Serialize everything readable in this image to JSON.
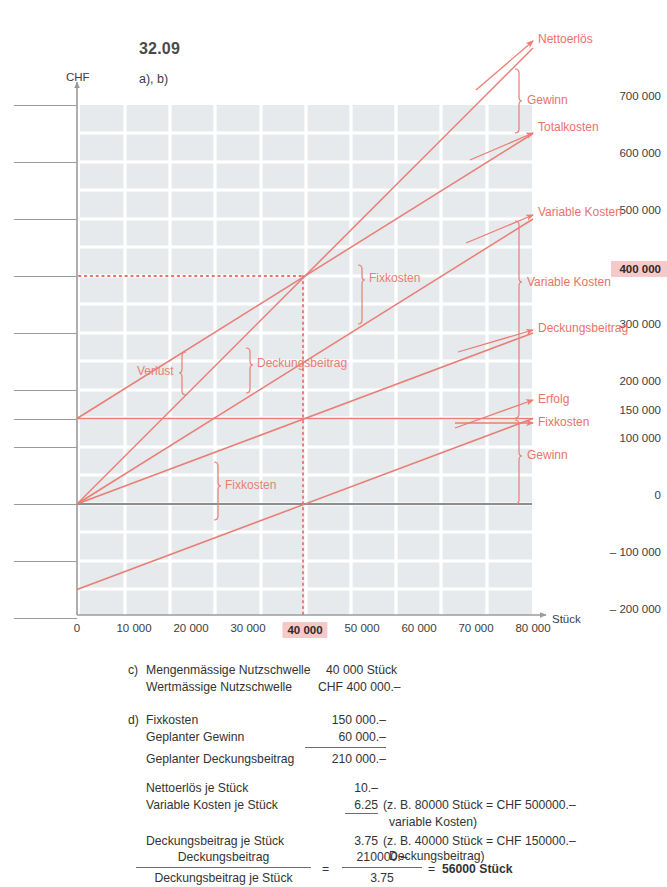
{
  "exercise": {
    "number": "32.09",
    "subparts": "a), b)"
  },
  "axes": {
    "y_unit": "CHF",
    "x_unit": "Stück",
    "y_ticks": [
      {
        "label": "700 000",
        "value": 700000,
        "highlight": false
      },
      {
        "label": "600 000",
        "value": 600000,
        "highlight": false
      },
      {
        "label": "500 000",
        "value": 500000,
        "highlight": false
      },
      {
        "label": "400 000",
        "value": 400000,
        "highlight": true
      },
      {
        "label": "300 000",
        "value": 300000,
        "highlight": false
      },
      {
        "label": "200 000",
        "value": 200000,
        "highlight": false
      },
      {
        "label": "150 000",
        "value": 150000,
        "highlight": false
      },
      {
        "label": "100 000",
        "value": 100000,
        "highlight": false
      },
      {
        "label": "0",
        "value": 0,
        "highlight": false
      },
      {
        "label": "– 100 000",
        "value": -100000,
        "highlight": false
      },
      {
        "label": "– 200 000",
        "value": -200000,
        "highlight": false
      }
    ],
    "x_ticks": [
      {
        "label": "0",
        "value": 0,
        "highlight": false
      },
      {
        "label": "10 000",
        "value": 10000,
        "highlight": false
      },
      {
        "label": "20 000",
        "value": 20000,
        "highlight": false
      },
      {
        "label": "30 000",
        "value": 30000,
        "highlight": false
      },
      {
        "label": "40 000",
        "value": 40000,
        "highlight": true
      },
      {
        "label": "50 000",
        "value": 50000,
        "highlight": false
      },
      {
        "label": "60 000",
        "value": 60000,
        "highlight": false
      },
      {
        "label": "70 000",
        "value": 70000,
        "highlight": false
      },
      {
        "label": "80 000",
        "value": 80000,
        "highlight": false
      }
    ]
  },
  "chart_data": {
    "type": "line",
    "xlabel": "Stück",
    "ylabel": "CHF",
    "xlim": [
      0,
      80000
    ],
    "ylim": [
      -200000,
      700000
    ],
    "grid": true,
    "legend": "inline-annotations",
    "breakeven": {
      "x": 40000,
      "y": 400000,
      "label_x": "40 000",
      "label_y": "400 000"
    },
    "series": [
      {
        "name": "Nettoerlös",
        "intercept": 0,
        "slope": 10.0,
        "x": [
          0,
          80000
        ],
        "values": [
          0,
          800000
        ]
      },
      {
        "name": "Totalkosten",
        "intercept": 150000,
        "slope": 6.25,
        "x": [
          0,
          80000
        ],
        "values": [
          150000,
          650000
        ]
      },
      {
        "name": "Variable Kosten",
        "intercept": 0,
        "slope": 6.25,
        "x": [
          0,
          80000
        ],
        "values": [
          0,
          500000
        ]
      },
      {
        "name": "Deckungsbeitrag",
        "intercept": 0,
        "slope": 3.75,
        "x": [
          0,
          80000
        ],
        "values": [
          0,
          300000
        ]
      },
      {
        "name": "Erfolg",
        "intercept": -150000,
        "slope": 3.75,
        "x": [
          0,
          80000
        ],
        "values": [
          -150000,
          150000
        ]
      },
      {
        "name": "Fixkosten",
        "intercept": 150000,
        "slope": 0,
        "x": [
          0,
          80000
        ],
        "values": [
          150000,
          150000
        ]
      }
    ],
    "annotations": [
      {
        "text": "Nettoerlös",
        "kind": "arrow-label",
        "at": [
          80000,
          800000
        ]
      },
      {
        "text": "Gewinn",
        "kind": "bracket-label",
        "at": [
          80000,
          725000
        ]
      },
      {
        "text": "Totalkosten",
        "kind": "arrow-label",
        "at": [
          80000,
          650000
        ]
      },
      {
        "text": "Variable Kosten",
        "kind": "arrow-label",
        "at": [
          80000,
          500000
        ]
      },
      {
        "text": "Variable Kosten",
        "kind": "bracket-label",
        "at": [
          80000,
          400000
        ]
      },
      {
        "text": "Deckungsbeitrag",
        "kind": "arrow-label",
        "at": [
          80000,
          300000
        ]
      },
      {
        "text": "Erfolg",
        "kind": "arrow-label",
        "at": [
          80000,
          150000
        ]
      },
      {
        "text": "Fixkosten",
        "kind": "arrow-label",
        "at": [
          80000,
          150000
        ]
      },
      {
        "text": "Gewinn",
        "kind": "bracket-label",
        "at": [
          80000,
          75000
        ]
      },
      {
        "text": "Fixkosten",
        "kind": "bracket-label",
        "at": [
          50000,
          450000
        ]
      },
      {
        "text": "Deckungsbeitrag",
        "kind": "bracket-label",
        "at": [
          30000,
          250000
        ]
      },
      {
        "text": "Verlust",
        "kind": "bracket-label",
        "at": [
          20000,
          230000
        ]
      },
      {
        "text": "Fixkosten",
        "kind": "bracket-label",
        "at": [
          25000,
          40000
        ]
      }
    ]
  },
  "solution": {
    "part_c": {
      "marker": "c)",
      "rows": [
        {
          "label": "Mengenmässige Nutzschwelle",
          "value": "40 000 Stück"
        },
        {
          "label": "Wertmässige Nutzschwelle",
          "value": "CHF 400 000.–"
        }
      ]
    },
    "part_d": {
      "marker": "d)",
      "block1": [
        {
          "label": "Fixkosten",
          "value": "150 000.–"
        },
        {
          "label": "Geplanter Gewinn",
          "value": "60 000.–"
        },
        {
          "label": "Geplanter Deckungsbeitrag",
          "value": "210 000.–"
        }
      ],
      "block2": [
        {
          "label": "Nettoerlös je Stück",
          "value": "10.–",
          "note": ""
        },
        {
          "label": "Variable Kosten je Stück",
          "value": "6.25",
          "note": "(z. B. 80000 Stück = CHF 500000.–"
        },
        {
          "label": "",
          "value": "",
          "note": "variable Kosten)"
        },
        {
          "label": "Deckungsbeitrag je Stück",
          "value": "3.75",
          "note": "(z. B. 40000 Stück = CHF 150000.–"
        },
        {
          "label": "",
          "value": "",
          "note": "Deckungsbeitrag)"
        }
      ],
      "formula": {
        "left_numerator": "Deckungsbeitrag",
        "left_denominator": "Deckungsbeitrag je Stück",
        "equals": "=",
        "right_numerator": "210000.–",
        "right_denominator": "3.75",
        "equals2": "=",
        "result": "56000 Stück"
      }
    }
  },
  "colors": {
    "line": "#ea7d74",
    "highlight_bg": "#f6c9c9",
    "grid": "#e3e7ea",
    "axis": "#8d8d8d",
    "text": "#3c3c3c"
  }
}
